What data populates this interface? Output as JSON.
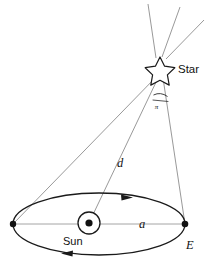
{
  "diagram": {
    "kind": "stellar-parallax-diagram",
    "background_color": "#ffffff",
    "stroke_color": "#1a1a1a",
    "thin_stroke_color": "#9a9a9a",
    "labels": {
      "star": "Star",
      "sun": "Sun",
      "earth": "E",
      "distance": "d",
      "semi_major_axis": "a",
      "parallax_angle": "π"
    },
    "icons": {
      "star_symbol": "star-outline-icon",
      "sun_symbol": "sun-circle-dot-icon",
      "earth_point": "earth-dot-icon",
      "orbit_direction_top": "arrow-left-icon",
      "orbit_direction_bottom": "arrow-right-icon"
    },
    "geometry": {
      "star_point": [
        160,
        69
      ],
      "sun_point": [
        89,
        223
      ],
      "earth_point": [
        185,
        224
      ],
      "orbit_left_vertex": [
        13,
        224
      ],
      "orbit_center": [
        99,
        224
      ],
      "orbit_rx": 86,
      "orbit_ry": 31,
      "starlight_rays": 3
    }
  }
}
